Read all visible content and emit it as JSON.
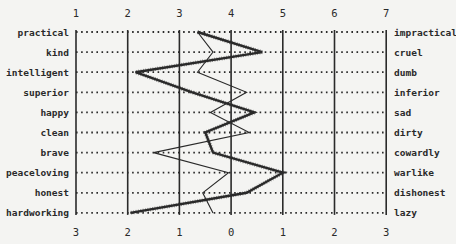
{
  "chart_data": {
    "type": "line",
    "title": "",
    "subtitle": "",
    "xlabel": "",
    "ylabel": "",
    "top_ticks": [
      "1",
      "2",
      "3",
      "4",
      "5",
      "6",
      "7"
    ],
    "bottom_ticks": [
      "3",
      "2",
      "1",
      "0",
      "1",
      "2",
      "3"
    ],
    "xlim": [
      1,
      7
    ],
    "grid": true,
    "left_labels": [
      "practical",
      "kind",
      "intelligent",
      "superior",
      "happy",
      "clean",
      "brave",
      "peaceloving",
      "honest",
      "hardworking"
    ],
    "right_labels": [
      "impractical",
      "cruel",
      "dumb",
      "inferior",
      "sad",
      "dirty",
      "cowardly",
      "warlike",
      "dishonest",
      "lazy"
    ],
    "series": [
      {
        "name": "profile-thin",
        "style": "thin solid",
        "values": [
          3.35,
          3.65,
          3.35,
          4.3,
          3.6,
          4.35,
          2.5,
          3.95,
          3.45,
          3.65
        ]
      },
      {
        "name": "profile-thick",
        "style": "thick hatched",
        "values": [
          3.35,
          4.6,
          2.15,
          3.25,
          4.45,
          3.5,
          3.65,
          5.0,
          4.3,
          2.05
        ]
      }
    ],
    "legend": []
  },
  "colors": {
    "background": "#f4f4f2",
    "ink": "#2a2a2a"
  }
}
